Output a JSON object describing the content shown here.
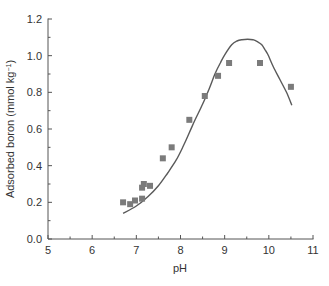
{
  "chart_data": {
    "type": "scatter",
    "title": "",
    "xlabel": "pH",
    "ylabel": "Adsorbed boron (mmol kg",
    "ylabel_superscript": "−1",
    "ylabel_suffix": ")",
    "xlim": [
      5,
      11
    ],
    "ylim": [
      0.0,
      1.2
    ],
    "x_ticks": [
      5,
      6,
      7,
      8,
      9,
      10,
      11
    ],
    "x_tick_labels": [
      "5",
      "6",
      "7",
      "8",
      "9",
      "10",
      "11"
    ],
    "x_minor_step": 0.5,
    "y_ticks": [
      0.0,
      0.2,
      0.4,
      0.6,
      0.8,
      1.0,
      1.2
    ],
    "y_tick_labels": [
      "0.0",
      "0.2",
      "0.4",
      "0.6",
      "0.8",
      "1.0",
      "1.2"
    ],
    "y_minor_step": 0.1,
    "grid": false,
    "legend": null,
    "series": [
      {
        "name": "Measured",
        "kind": "scatter",
        "marker": "square",
        "color": "#7b7b7b",
        "points": [
          {
            "x": 6.7,
            "y": 0.2
          },
          {
            "x": 6.86,
            "y": 0.19
          },
          {
            "x": 6.97,
            "y": 0.21
          },
          {
            "x": 7.13,
            "y": 0.22
          },
          {
            "x": 7.13,
            "y": 0.28
          },
          {
            "x": 7.17,
            "y": 0.3
          },
          {
            "x": 7.31,
            "y": 0.29
          },
          {
            "x": 7.6,
            "y": 0.44
          },
          {
            "x": 7.8,
            "y": 0.5
          },
          {
            "x": 8.2,
            "y": 0.65
          },
          {
            "x": 8.55,
            "y": 0.78
          },
          {
            "x": 8.85,
            "y": 0.89
          },
          {
            "x": 9.1,
            "y": 0.96
          },
          {
            "x": 9.8,
            "y": 0.96
          },
          {
            "x": 10.5,
            "y": 0.83
          }
        ]
      },
      {
        "name": "Model",
        "kind": "line",
        "color": "#5a5a5a",
        "points": [
          {
            "x": 6.7,
            "y": 0.14
          },
          {
            "x": 7.0,
            "y": 0.18
          },
          {
            "x": 7.26,
            "y": 0.23
          },
          {
            "x": 7.5,
            "y": 0.29
          },
          {
            "x": 7.71,
            "y": 0.36
          },
          {
            "x": 7.9,
            "y": 0.43
          },
          {
            "x": 8.05,
            "y": 0.5
          },
          {
            "x": 8.2,
            "y": 0.58
          },
          {
            "x": 8.33,
            "y": 0.65
          },
          {
            "x": 8.51,
            "y": 0.74
          },
          {
            "x": 8.65,
            "y": 0.82
          },
          {
            "x": 8.78,
            "y": 0.9
          },
          {
            "x": 8.9,
            "y": 0.96
          },
          {
            "x": 9.0,
            "y": 1.005
          },
          {
            "x": 9.16,
            "y": 1.06
          },
          {
            "x": 9.28,
            "y": 1.08
          },
          {
            "x": 9.39,
            "y": 1.087
          },
          {
            "x": 9.52,
            "y": 1.09
          },
          {
            "x": 9.64,
            "y": 1.087
          },
          {
            "x": 9.75,
            "y": 1.075
          },
          {
            "x": 9.84,
            "y": 1.06
          },
          {
            "x": 9.92,
            "y": 1.03
          },
          {
            "x": 9.98,
            "y": 1.005
          },
          {
            "x": 10.1,
            "y": 0.94
          },
          {
            "x": 10.25,
            "y": 0.87
          },
          {
            "x": 10.4,
            "y": 0.8
          },
          {
            "x": 10.52,
            "y": 0.73
          }
        ]
      }
    ]
  }
}
